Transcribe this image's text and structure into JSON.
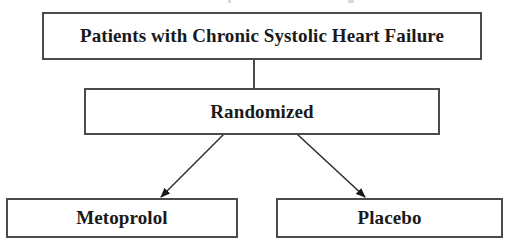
{
  "diagram": {
    "nodes": [
      {
        "id": "population",
        "label": "Patients with Chronic Systolic Heart Failure"
      },
      {
        "id": "randomized",
        "label": "Randomized"
      },
      {
        "id": "arm_metoprolol",
        "label": "Metoprolol"
      },
      {
        "id": "arm_placebo",
        "label": "Placebo"
      }
    ],
    "edges": [
      {
        "from": "population",
        "to": "randomized",
        "style": "line"
      },
      {
        "from": "randomized",
        "to": "arm_metoprolol",
        "style": "arrow"
      },
      {
        "from": "randomized",
        "to": "arm_placebo",
        "style": "arrow"
      }
    ],
    "colors": {
      "border": "#4a4a4a",
      "text": "#1a1a1a",
      "background": "#ffffff"
    }
  }
}
